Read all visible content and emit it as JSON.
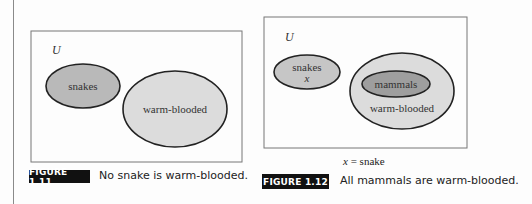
{
  "figures": [
    {
      "id": "1.11",
      "label": "FIGURE 1.11",
      "caption": "No snake is warm-blooded.",
      "universe_label": "U",
      "sets": [
        {
          "name": "snakes",
          "label": "snakes",
          "fill": "#b9b9b9"
        },
        {
          "name": "warm-blooded",
          "label": "warm-blooded",
          "fill": "#dcdcdc"
        }
      ],
      "relationship": "disjoint"
    },
    {
      "id": "1.12",
      "label": "FIGURE 1.12",
      "caption": "All mammals are warm-blooded.",
      "universe_label": "U",
      "sets": [
        {
          "name": "snakes",
          "label": "snakes",
          "element": "x",
          "fill": "#c6c6c6"
        },
        {
          "name": "warm-blooded",
          "label": "warm-blooded",
          "fill": "#dcdcdc"
        },
        {
          "name": "mammals",
          "label": "mammals",
          "fill": "#9e9e9e"
        }
      ],
      "relationship": "mammals subset of warm-blooded; snakes disjoint",
      "note": {
        "var": "x",
        "text": " = snake"
      }
    }
  ],
  "colors": {
    "border": "#777777",
    "outline": "#222222",
    "label_bg": "#111111",
    "label_text": "#ffffff"
  }
}
